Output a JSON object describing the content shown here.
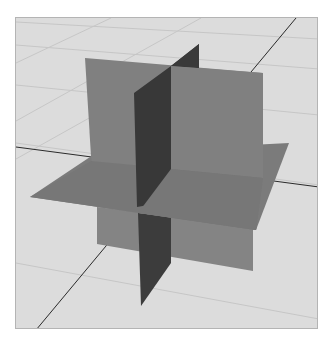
{
  "scene": {
    "title": "Three intersecting orthogonal planes",
    "background_color": "#dcdcdc",
    "grid_line_color": "#c4c4c4",
    "axis_line_color": "#2a2a2a",
    "planes": [
      {
        "name": "back-vertical-plane",
        "color": "#7e7e7e"
      },
      {
        "name": "horizontal-plane",
        "color": "#7a7a7a"
      },
      {
        "name": "side-vertical-plane",
        "color": "#3a3a3a"
      }
    ]
  }
}
